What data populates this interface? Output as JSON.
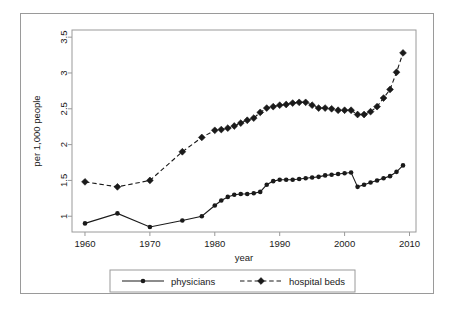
{
  "figure": {
    "title": "",
    "frame_color": "#9a9a9a",
    "background": "#ffffff",
    "series_color": "#1a1a1a"
  },
  "axes": {
    "xlabel": "year",
    "ylabel": "per 1,000 people",
    "x_ticks": [
      "1960",
      "1970",
      "1980",
      "1990",
      "2000",
      "2010"
    ],
    "y_ticks": [
      "1",
      "1.5",
      "2",
      "2.5",
      "3",
      "3.5"
    ]
  },
  "legend": {
    "items": [
      {
        "label": "physicians",
        "marker": "circle-marker",
        "line": "solid"
      },
      {
        "label": "hospital beds",
        "marker": "diamond-marker",
        "line": "dashed"
      }
    ]
  },
  "chart_data": {
    "type": "line",
    "title": "",
    "xlabel": "year",
    "ylabel": "per 1,000 people",
    "xlim": [
      1958,
      2011
    ],
    "ylim": [
      0.78,
      3.6
    ],
    "x_ticks": [
      1960,
      1970,
      1980,
      1990,
      2000,
      2010
    ],
    "y_ticks": [
      1,
      1.5,
      2,
      2.5,
      3,
      3.5
    ],
    "grid": false,
    "legend_position": "bottom-outside",
    "series": [
      {
        "name": "physicians",
        "marker": "circle",
        "linestyle": "solid",
        "color": "#1a1a1a",
        "x": [
          1960,
          1965,
          1970,
          1975,
          1978,
          1980,
          1981,
          1982,
          1983,
          1984,
          1985,
          1986,
          1987,
          1988,
          1989,
          1990,
          1991,
          1992,
          1993,
          1994,
          1995,
          1996,
          1997,
          1998,
          1999,
          2000,
          2001,
          2002,
          2003,
          2004,
          2005,
          2006,
          2007,
          2008,
          2009
        ],
        "values": [
          0.9,
          1.04,
          0.85,
          0.94,
          1.0,
          1.15,
          1.22,
          1.27,
          1.3,
          1.31,
          1.31,
          1.32,
          1.34,
          1.44,
          1.49,
          1.51,
          1.51,
          1.51,
          1.52,
          1.53,
          1.54,
          1.55,
          1.57,
          1.58,
          1.59,
          1.6,
          1.61,
          1.41,
          1.44,
          1.47,
          1.5,
          1.53,
          1.56,
          1.62,
          1.71
        ]
      },
      {
        "name": "hospital beds",
        "marker": "diamond",
        "linestyle": "dashed",
        "color": "#1a1a1a",
        "x": [
          1960,
          1965,
          1970,
          1975,
          1978,
          1980,
          1981,
          1982,
          1983,
          1984,
          1985,
          1986,
          1987,
          1988,
          1989,
          1990,
          1991,
          1992,
          1993,
          1994,
          1995,
          1996,
          1997,
          1998,
          1999,
          2000,
          2001,
          2002,
          2003,
          2004,
          2005,
          2006,
          2007,
          2008,
          2009
        ],
        "values": [
          1.48,
          1.41,
          1.5,
          1.9,
          2.1,
          2.2,
          2.21,
          2.23,
          2.26,
          2.3,
          2.34,
          2.37,
          2.45,
          2.51,
          2.53,
          2.55,
          2.56,
          2.58,
          2.59,
          2.59,
          2.55,
          2.51,
          2.51,
          2.5,
          2.48,
          2.48,
          2.48,
          2.42,
          2.42,
          2.46,
          2.53,
          2.65,
          2.77,
          3.01,
          3.28
        ]
      }
    ]
  }
}
